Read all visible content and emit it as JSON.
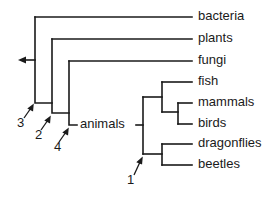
{
  "diagram": {
    "type": "cladogram",
    "leaves": [
      {
        "id": "bacteria",
        "label": "bacteria"
      },
      {
        "id": "plants",
        "label": "plants"
      },
      {
        "id": "fungi",
        "label": "fungi"
      },
      {
        "id": "fish",
        "label": "fish"
      },
      {
        "id": "mammals",
        "label": "mammals"
      },
      {
        "id": "birds",
        "label": "birds"
      },
      {
        "id": "dragonflies",
        "label": "dragonflies"
      },
      {
        "id": "beetles",
        "label": "beetles"
      }
    ],
    "internal_labels": {
      "animals": "animals"
    },
    "markers": {
      "m1": "1",
      "m2": "2",
      "m3": "3",
      "m4": "4"
    },
    "colors": {
      "line": "#1a1a1a",
      "background": "#ffffff"
    }
  }
}
